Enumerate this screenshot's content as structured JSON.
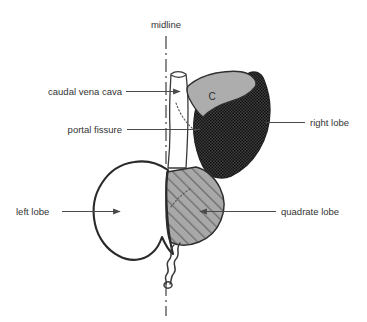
{
  "figure": {
    "kind": "anatomical-diagram",
    "background_color": "#ffffff"
  },
  "labels": {
    "midline": "midline",
    "caudal_vena_cava": "caudal vena cava",
    "portal_fissure": "portal fissure",
    "right_lobe": "right lobe",
    "left_lobe": "left lobe",
    "quadrate_lobe": "quadrate lobe",
    "caudate_marker": "C"
  },
  "colors": {
    "text": "#333333",
    "leader": "#4a4a4a",
    "midline": "#4f4f4f",
    "outline": "#2a2a2a",
    "left_lobe_fill": "#ebebeb",
    "quadrate_lobe_fill": "#a8a8a8",
    "quadrate_lobe_hatch": "#6d6d6d",
    "right_lobe_fill": "#3a3a3a",
    "right_lobe_dots": "#111111",
    "caudate_fill": "#adadad",
    "vena_cava_fill": "#e4e4e4"
  },
  "regions": [
    {
      "name": "left lobe",
      "fill_style": "solid light gray"
    },
    {
      "name": "quadrate lobe",
      "fill_style": "diagonal hatch on medium gray"
    },
    {
      "name": "right lobe",
      "fill_style": "dark checkered stipple"
    },
    {
      "name": "caudate lobe",
      "fill_style": "solid medium gray",
      "marker": "C"
    },
    {
      "name": "caudal vena cava",
      "fill_style": "solid pale gray tube"
    }
  ]
}
